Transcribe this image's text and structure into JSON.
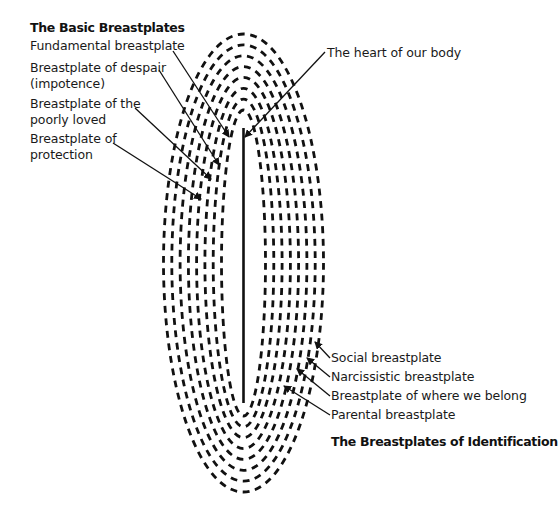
{
  "diagram": {
    "left_group": {
      "heading": "The Basic Breastplates",
      "labels": [
        {
          "lines": [
            "Fundamental breastplate"
          ]
        },
        {
          "lines": [
            "Breastplate of despair",
            "(impotence)"
          ]
        },
        {
          "lines": [
            "Breastplate of the",
            "poorly loved"
          ]
        },
        {
          "lines": [
            "Breastplate of",
            "protection"
          ]
        }
      ]
    },
    "center_label": "The heart of our body",
    "right_group": {
      "heading": "The Breastplates of Identification",
      "labels": [
        {
          "lines": [
            "Social breastplate"
          ]
        },
        {
          "lines": [
            "Narcissistic breastplate"
          ]
        },
        {
          "lines": [
            "Breastplate of where we belong"
          ]
        },
        {
          "lines": [
            "Parental breastplate"
          ]
        }
      ]
    },
    "rings": 8,
    "stroke_color": "#111111"
  }
}
